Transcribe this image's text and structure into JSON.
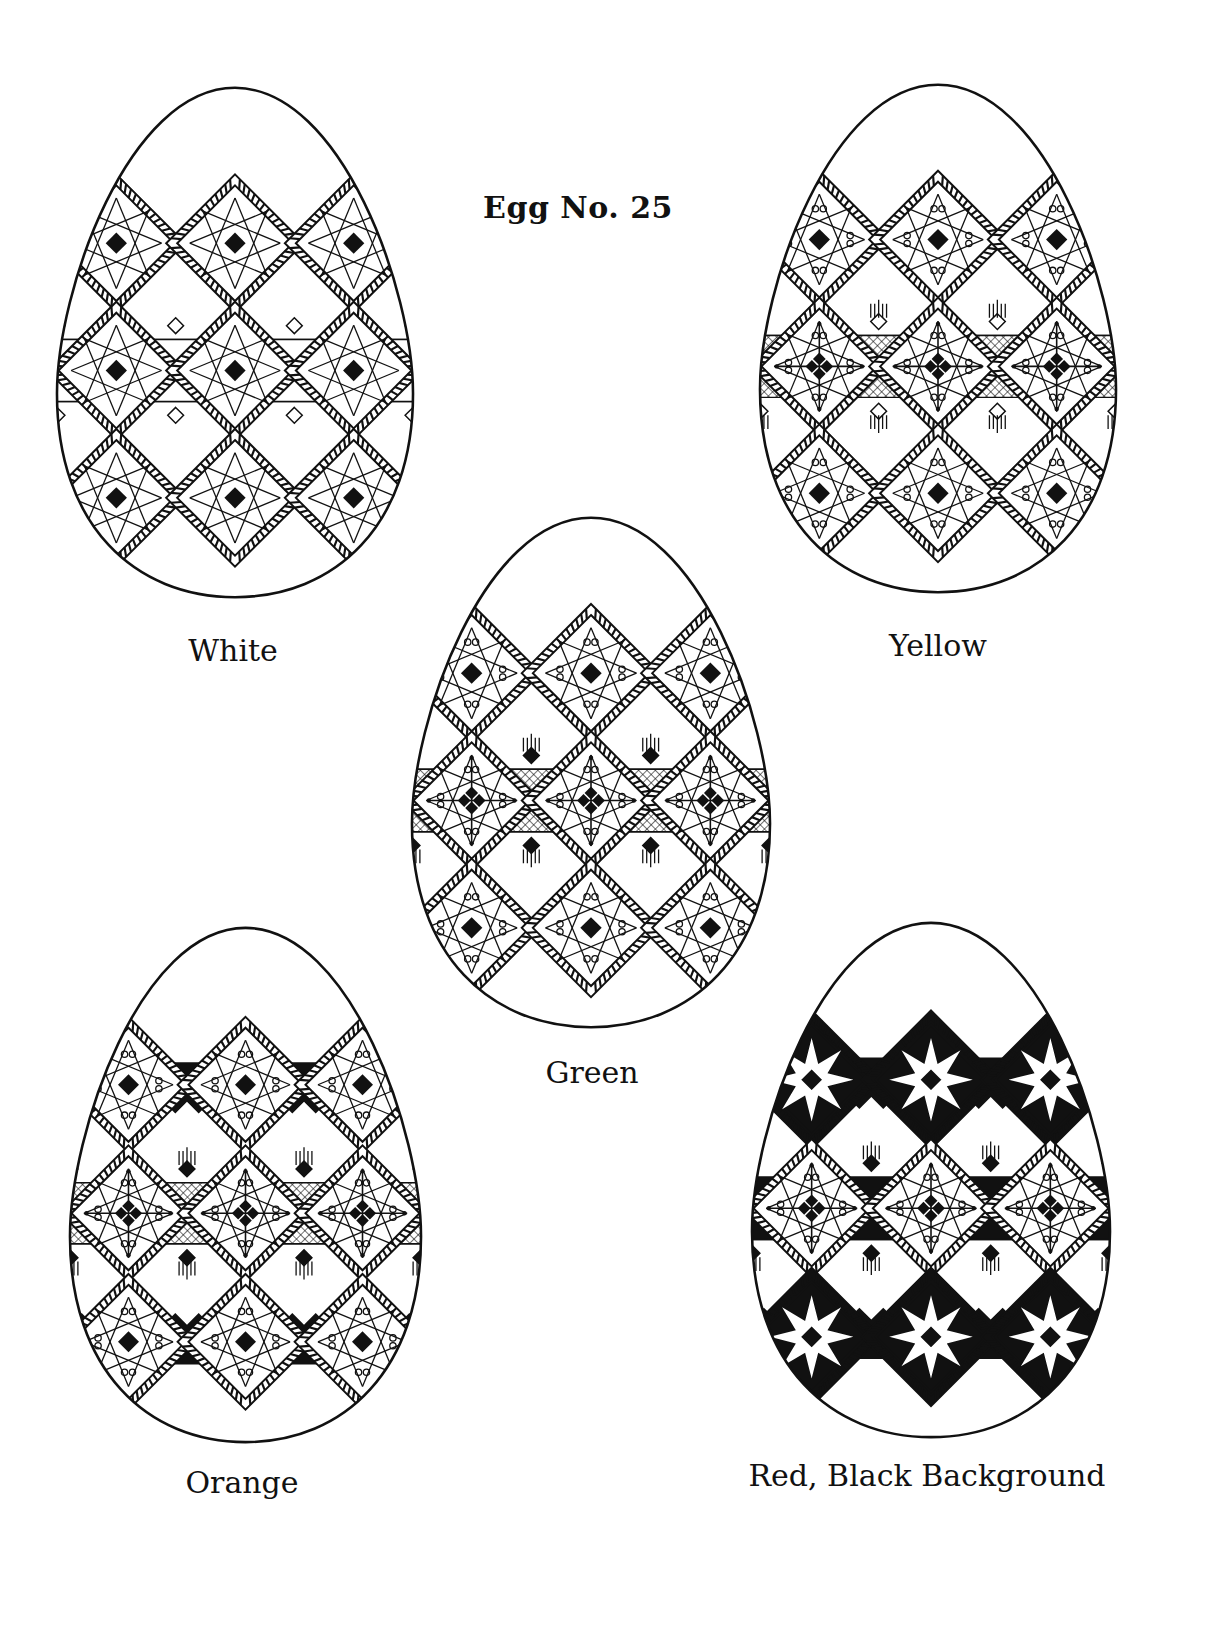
{
  "page": {
    "title": "Egg No. 25"
  },
  "colors": {
    "ink": "#111111",
    "paper": "#ffffff"
  },
  "eggs": [
    {
      "id": "white",
      "caption": "White",
      "variant": "outline",
      "box": {
        "x": 55,
        "y": 85,
        "w": 360,
        "h": 515
      },
      "caption_pos": {
        "x": 233,
        "y": 633
      }
    },
    {
      "id": "yellow",
      "caption": "Yellow",
      "variant": "hatched",
      "box": {
        "x": 758,
        "y": 82,
        "w": 360,
        "h": 513
      },
      "caption_pos": {
        "x": 938,
        "y": 628
      }
    },
    {
      "id": "green",
      "caption": "Green",
      "variant": "hatched-filled",
      "box": {
        "x": 410,
        "y": 515,
        "w": 362,
        "h": 515
      },
      "caption_pos": {
        "x": 592,
        "y": 1055
      }
    },
    {
      "id": "orange",
      "caption": "Orange",
      "variant": "zigzag",
      "box": {
        "x": 68,
        "y": 925,
        "w": 355,
        "h": 520
      },
      "caption_pos": {
        "x": 242,
        "y": 1465
      }
    },
    {
      "id": "red",
      "caption": "Red, Black Background",
      "variant": "black",
      "box": {
        "x": 750,
        "y": 920,
        "w": 362,
        "h": 520
      },
      "caption_pos": {
        "x": 927,
        "y": 1458
      }
    }
  ]
}
